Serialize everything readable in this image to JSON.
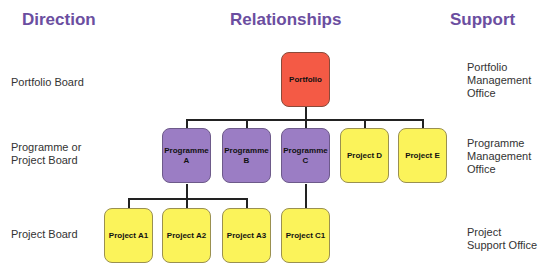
{
  "headings": {
    "direction": "Direction",
    "relationships": "Relationships",
    "support": "Support"
  },
  "direction_labels": {
    "portfolio": "Portfolio Board",
    "programme_line1": "Programme or",
    "programme_line2": "Project Board",
    "project": "Project Board"
  },
  "support_labels": {
    "portfolio_line1": "Portfolio",
    "portfolio_line2": "Management",
    "portfolio_line3": "Office",
    "programme_line1": "Programme",
    "programme_line2": "Management",
    "programme_line3": "Office",
    "project_line1": "Project",
    "project_line2": "Support Office"
  },
  "nodes": {
    "portfolio": {
      "label": "Portfolio",
      "color": "#f45a45"
    },
    "programme_a": {
      "line1": "Programme",
      "line2": "A",
      "color": "#9b7dc4"
    },
    "programme_b": {
      "line1": "Programme",
      "line2": "B",
      "color": "#9b7dc4"
    },
    "programme_c": {
      "line1": "Programme",
      "line2": "C",
      "color": "#9b7dc4"
    },
    "project_d": {
      "label": "Project D",
      "color": "#fbf35a"
    },
    "project_e": {
      "label": "Project E",
      "color": "#fbf35a"
    },
    "project_a1": {
      "label": "Project A1",
      "color": "#fbf35a"
    },
    "project_a2": {
      "label": "Project A2",
      "color": "#fbf35a"
    },
    "project_a3": {
      "label": "Project A3",
      "color": "#fbf35a"
    },
    "project_c1": {
      "label": "Project C1",
      "color": "#fbf35a"
    }
  }
}
